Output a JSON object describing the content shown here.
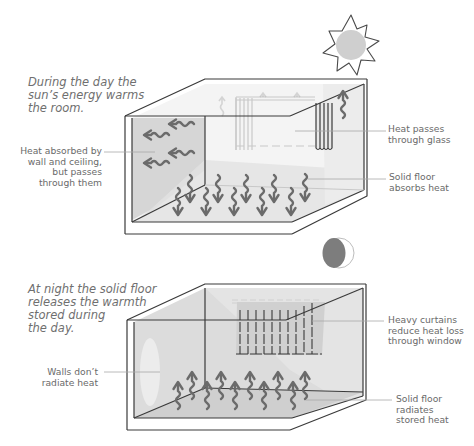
{
  "day_panel": {
    "caption": [
      "During the day the",
      "sun’s energy warms",
      "the room."
    ],
    "labels": {
      "wall": [
        "Heat absorbed by",
        "wall and ceiling,",
        "but passes",
        "through them"
      ],
      "glass": [
        "Heat passes",
        "through glass"
      ],
      "floor": [
        "Solid floor",
        "absorbs heat"
      ]
    },
    "icon": "sun-icon"
  },
  "night_panel": {
    "caption": [
      "At night the solid floor",
      "releases the warmth",
      "stored during",
      "the day."
    ],
    "labels": {
      "walls": [
        "Walls don’t",
        "radiate heat"
      ],
      "curtains": [
        "Heavy curtains",
        "reduce heat loss",
        "through window"
      ],
      "floor": [
        "Solid floor",
        "radiates",
        "stored heat"
      ]
    },
    "icon": "moon-icon"
  },
  "colors": {
    "line": "#3a3a3a",
    "arrow": "#6b6b6b",
    "wall_shade": "#d4d4d4",
    "light_shade": "#ececec",
    "sun": "#cfcfcf",
    "moon": "#7d7d7d",
    "leader": "#a8a8a8"
  }
}
